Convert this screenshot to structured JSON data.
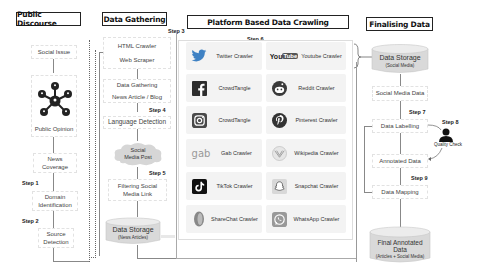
{
  "columns": {
    "public_discourse": {
      "title": "Public Discourse",
      "nodes": [
        {
          "label": "Social Issue"
        },
        {
          "label": "Public Opinion",
          "icon": "network-people-icon"
        },
        {
          "label": "News Coverage"
        },
        {
          "label": "Domain Identification"
        },
        {
          "label": "Source Detection"
        }
      ],
      "steps": {
        "step1": "Step 1",
        "step2": "Step 2"
      }
    },
    "data_gathering": {
      "title": "Data Gathering",
      "steps": {
        "step3": "Step 3",
        "step4": "Step 4",
        "step5": "Step 5"
      },
      "nodes": {
        "crawler_line1": "HTML Crawler",
        "crawler_line2": "Web Scraper",
        "gathering_line1": "Data Gathering",
        "gathering_line2": "News Article / Blog",
        "language": "Language Detection",
        "social_post": "Social Media Post",
        "filtering": "Filtering Social Media Link",
        "storage_title": "Data Storage",
        "storage_sub": "(News Articles)"
      }
    },
    "platform_crawling": {
      "title": "Platform Based Data Crawling",
      "step": "Step 6",
      "crawlers": [
        {
          "label": "Twitter Crawler",
          "icon": "twitter-icon"
        },
        {
          "label": "Youtube Crawler",
          "icon": "youtube-icon"
        },
        {
          "label": "CrowdTangle",
          "icon": "facebook-icon"
        },
        {
          "label": "Reddit Crawler",
          "icon": "reddit-icon"
        },
        {
          "label": "CrowdTangle",
          "icon": "instagram-icon"
        },
        {
          "label": "Pinterest Crawler",
          "icon": "pinterest-icon"
        },
        {
          "label": "Gab Crawler",
          "icon": "gab-icon"
        },
        {
          "label": "Wikipedia Crawler",
          "icon": "wikipedia-icon"
        },
        {
          "label": "TikTok Crawler",
          "icon": "tiktok-icon"
        },
        {
          "label": "Snapchat Crawler",
          "icon": "snapchat-icon"
        },
        {
          "label": "ShareChat Crawler",
          "icon": "sharechat-icon"
        },
        {
          "label": "WhatsApp Crawler",
          "icon": "whatsapp-icon"
        }
      ],
      "youtube_logo": {
        "you": "You",
        "tube": "Tube"
      },
      "gab_logo": "gab"
    },
    "finalising": {
      "title": "Finalising Data",
      "steps": {
        "step7": "Step 7",
        "step8": "Step 8",
        "step9": "Step 9"
      },
      "nodes": {
        "storage_title": "Data Storage",
        "storage_sub": "(Social Media)",
        "social_media_data": "Social Media Data",
        "labelling": "Data Labelling",
        "quality_check": "Quality Check",
        "annotated": "Annotated Data",
        "mapping": "Data Mapping",
        "final_line1": "Final Annotated",
        "final_line2": "Data",
        "final_sub": "(Articles + Social Media)"
      }
    }
  },
  "colors": {
    "twitter": "#1da1f2",
    "facebook": "#1877f2",
    "reddit": "#ff4500",
    "pinterest": "#e60023",
    "gab": "#21cf7a",
    "cylinder_fill": "#d9d9d9",
    "cylinder_top": "#ececec"
  }
}
